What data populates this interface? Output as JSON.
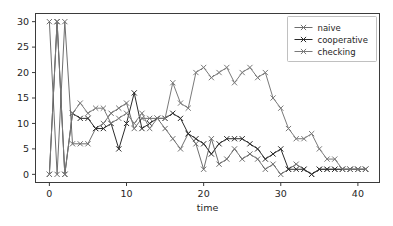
{
  "chart_data": {
    "type": "line",
    "title": "",
    "xlabel": "time",
    "ylabel": "",
    "xlim": [
      -1.8,
      42.8
    ],
    "ylim": [
      -1.6,
      31.6
    ],
    "xticks": [
      0,
      10,
      20,
      30,
      40
    ],
    "yticks": [
      0,
      5,
      10,
      15,
      20,
      25,
      30
    ],
    "grid": false,
    "legend_position": "upper right",
    "marker": "x",
    "x": [
      0,
      1,
      2,
      3,
      4,
      5,
      6,
      7,
      8,
      9,
      10,
      11,
      12,
      13,
      14,
      15,
      16,
      17,
      18,
      19,
      20,
      21,
      22,
      23,
      24,
      25,
      26,
      27,
      28,
      29,
      30,
      31,
      32,
      33,
      34,
      35,
      36,
      37,
      38,
      39,
      40,
      41
    ],
    "series": [
      {
        "name": "naive",
        "color": "#6e6e6e",
        "values": [
          30,
          0,
          30,
          6,
          6,
          6,
          9,
          10,
          12,
          13,
          14,
          9,
          11,
          11,
          11,
          9,
          7,
          5,
          8,
          6,
          1,
          7,
          2,
          3,
          5,
          3,
          4,
          3,
          1,
          2,
          0,
          1,
          2,
          1,
          0,
          1,
          1,
          1,
          1,
          1,
          1,
          1
        ]
      },
      {
        "name": "cooperative",
        "color": "#2b2b2b",
        "values": [
          0,
          30,
          0,
          12,
          11,
          11,
          9,
          9,
          10,
          5,
          10,
          16,
          9,
          10,
          11,
          11,
          12,
          11,
          8,
          7,
          6,
          4,
          6,
          7,
          7,
          7,
          6,
          5,
          3,
          4,
          5,
          1,
          1,
          1,
          0,
          1,
          1,
          1,
          1,
          1,
          1,
          1
        ]
      },
      {
        "name": "checking",
        "color": "#7a7a7a",
        "values": [
          0,
          30,
          0,
          12,
          14,
          12,
          13,
          13,
          10,
          11,
          12,
          10,
          12,
          9,
          11,
          11,
          18,
          14,
          13,
          20,
          21,
          19,
          20,
          21,
          18,
          20,
          21,
          19,
          20,
          15,
          13,
          9,
          7,
          7,
          8,
          5,
          3,
          3,
          1,
          1,
          1,
          1
        ]
      }
    ]
  },
  "legend": {
    "items": [
      {
        "label": "naive"
      },
      {
        "label": "cooperative"
      },
      {
        "label": "checking"
      }
    ]
  },
  "axes": {
    "xlabel": "time",
    "xtick_labels": [
      "0",
      "10",
      "20",
      "30",
      "40"
    ],
    "ytick_labels": [
      "0",
      "5",
      "10",
      "15",
      "20",
      "25",
      "30"
    ]
  }
}
